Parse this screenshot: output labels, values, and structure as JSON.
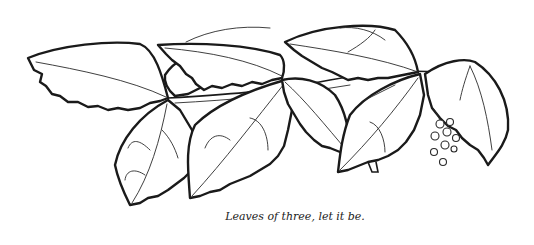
{
  "illustration": {
    "subject": "poison ivy branch line drawing",
    "leaflet_groups": 3,
    "berry_cluster_count": 9
  },
  "caption": "Leaves of three, let it be.",
  "colors": {
    "ink": "#1a1a1a",
    "background": "#ffffff"
  }
}
